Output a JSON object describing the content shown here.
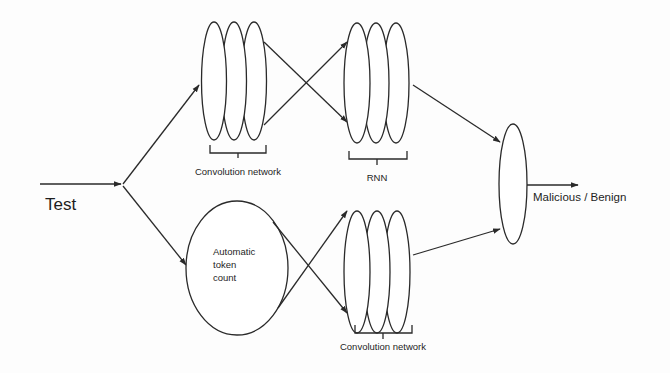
{
  "diagram": {
    "type": "flowchart",
    "input": {
      "label": "Test"
    },
    "nodes": {
      "conv_top": {
        "label": "Convolution network",
        "layers": 3
      },
      "rnn": {
        "label": "RNN",
        "layers": 3
      },
      "token_count": {
        "label_lines": [
          "Automatic",
          "token",
          "count"
        ]
      },
      "conv_bottom": {
        "label": "Convolution network",
        "layers": 3
      },
      "classifier": {
        "label": ""
      }
    },
    "output": {
      "label": "Malicious / Benign"
    },
    "edges": [
      {
        "from": "input",
        "to": "conv_top"
      },
      {
        "from": "input",
        "to": "token_count"
      },
      {
        "from": "conv_top",
        "to": "rnn",
        "style": "crossed pair"
      },
      {
        "from": "token_count",
        "to": "conv_bottom",
        "style": "crossed pair"
      },
      {
        "from": "rnn",
        "to": "classifier"
      },
      {
        "from": "conv_bottom",
        "to": "classifier"
      },
      {
        "from": "classifier",
        "to": "output"
      }
    ],
    "colors": {
      "stroke": "#2a2a2a",
      "background": "#fdfdfd",
      "text": "#1e1e1e"
    }
  }
}
